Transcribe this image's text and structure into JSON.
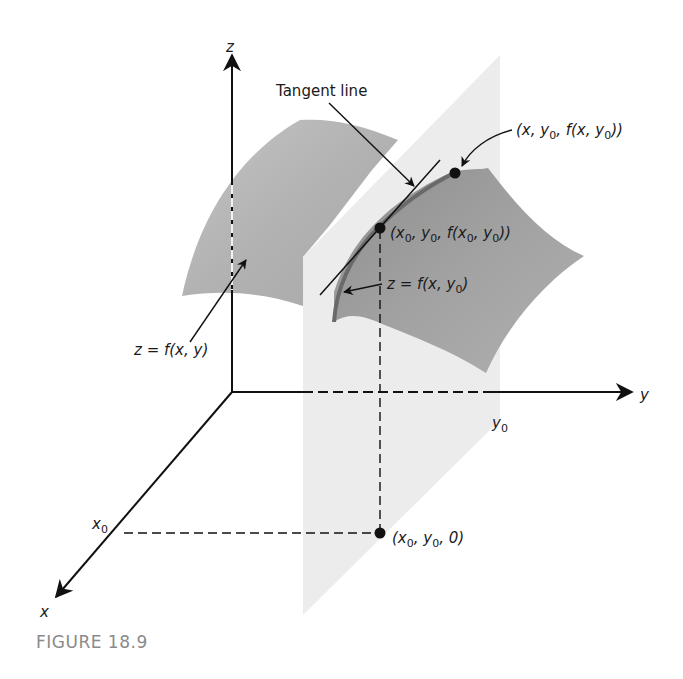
{
  "figure": {
    "caption": "FIGURE 18.9"
  },
  "axes": {
    "x_label": "x",
    "y_label": "y",
    "z_label": "z",
    "x0_label": "x",
    "x0_sub": "0",
    "y0_label": "y",
    "y0_sub": "0"
  },
  "labels": {
    "tangent_line": "Tangent line",
    "surface_main": "z = f(x, y)",
    "surface_curve_pre": "z = f(x, y",
    "surface_curve_sub": "0",
    "surface_curve_post": ")",
    "point_moving": {
      "p1": "(x, y",
      "s1": "0",
      "p2": ", f(x, y",
      "s2": "0",
      "p3": "))"
    },
    "point_tangent": {
      "p1": "(x",
      "s1": "0",
      "p2": ", y",
      "s2": "0",
      "p3": ", f(x",
      "s3": "0",
      "p4": ", y",
      "s4": "0",
      "p5": "))"
    },
    "point_base": {
      "p1": "(x",
      "s1": "0",
      "p2": ", y",
      "s2": "0",
      "p3": ", 0)"
    }
  },
  "colors": {
    "axis": "#111111",
    "plane": "#ececec",
    "surface_back": "#b4b4b4",
    "surface_front": "#9a9a9a",
    "caption": "#8a8a8a"
  }
}
